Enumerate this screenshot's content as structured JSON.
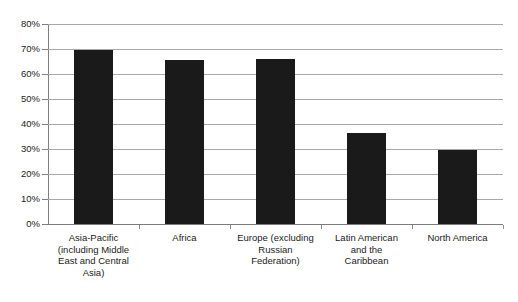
{
  "chart_data": {
    "type": "bar",
    "title": "",
    "subtitle": "",
    "xlabel": "",
    "ylabel": "",
    "categories": [
      "Asia-Pacific (including Middle East and Central Asia)",
      "Africa",
      "Europe (excluding Russian Federation)",
      "Latin American and the Caribbean",
      "North America"
    ],
    "values": [
      69.5,
      65.5,
      66.0,
      36.5,
      29.5
    ],
    "ylim": [
      0,
      80
    ],
    "y_tick_values": [
      0,
      10,
      20,
      30,
      40,
      50,
      60,
      70,
      80
    ],
    "y_tick_labels": [
      "0%",
      "10%",
      "20%",
      "30%",
      "40%",
      "50%",
      "60%",
      "70%",
      "80%"
    ],
    "grid": true,
    "grid_axis": "y",
    "legend": false,
    "legend_position": "none",
    "bar_color": "#1a1a1a",
    "grid_color": "#a8a8a8",
    "axis_color": "#7d7d7d",
    "background_color": "#ffffff",
    "text_color": "#1b1b1b"
  },
  "axis": {
    "y_labels": [
      {
        "text": "80%",
        "value": 80
      },
      {
        "text": "70%",
        "value": 70
      },
      {
        "text": "60%",
        "value": 60
      },
      {
        "text": "50%",
        "value": 50
      },
      {
        "text": "40%",
        "value": 40
      },
      {
        "text": "30%",
        "value": 30
      },
      {
        "text": "20%",
        "value": 20
      },
      {
        "text": "10%",
        "value": 10
      },
      {
        "text": "0%",
        "value": 0
      }
    ]
  },
  "x_labels": [
    {
      "lines": [
        "Asia-Pacific",
        "(including Middle",
        "East and Central",
        "Asia)"
      ]
    },
    {
      "lines": [
        "Africa"
      ]
    },
    {
      "lines": [
        "Europe (excluding",
        "Russian",
        "Federation)"
      ]
    },
    {
      "lines": [
        "Latin American",
        "and the",
        "Caribbean"
      ]
    },
    {
      "lines": [
        "North America"
      ]
    }
  ]
}
